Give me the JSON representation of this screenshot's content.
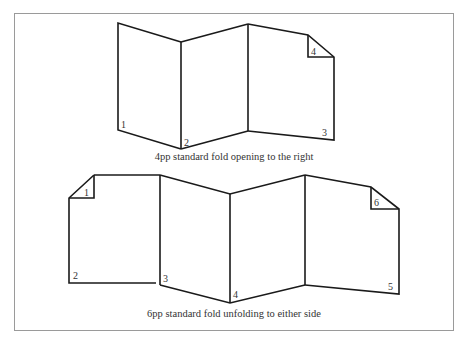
{
  "figure": {
    "frame_color": "#9a9a9a",
    "line_color": "#1a1a1a",
    "diagrams": [
      {
        "id": "4pp",
        "caption": "4pp standard fold opening to the right",
        "page_labels": [
          "1",
          "2",
          "3",
          "4"
        ]
      },
      {
        "id": "6pp",
        "caption": "6pp standard fold unfolding to either side",
        "page_labels": [
          "1",
          "2",
          "3",
          "4",
          "5",
          "6"
        ]
      }
    ],
    "figure_caption_partial": ""
  }
}
